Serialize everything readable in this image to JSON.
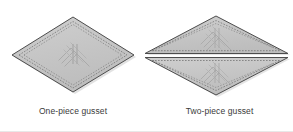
{
  "figure": {
    "width": 293,
    "height": 132,
    "background": "#ffffff",
    "border_color": "#e8e8e8",
    "title": "",
    "panels": [
      {
        "id": "one-piece",
        "caption": "One-piece gusset",
        "shape": "diamond",
        "piece_count": 1,
        "outline_color": "#4d4d4d",
        "fill_color": "#c6c6c6",
        "stitch_color": "#6b6b6b",
        "stitch_style": "dashed",
        "geometry": {
          "left_vertex": [
            12,
            55
          ],
          "top_vertex": [
            73,
            17
          ],
          "right_vertex": [
            134,
            55
          ],
          "bottom_vertex": [
            73,
            92
          ]
        }
      },
      {
        "id": "two-piece",
        "caption": "Two-piece gusset",
        "shape": "split-diamond",
        "piece_count": 2,
        "outline_color": "#4d4d4d",
        "fill_color": "#c6c6c6",
        "stitch_color": "#6b6b6b",
        "stitch_style": "dashed",
        "geometry": {
          "left_vertex": [
            145,
            55
          ],
          "top_vertex": [
            216,
            16
          ],
          "right_vertex": [
            288,
            55
          ],
          "bottom_vertex": [
            216,
            95
          ],
          "split_axis": "horizontal",
          "split_y": 55,
          "seam_gap": 4
        }
      }
    ],
    "captions": {
      "one_piece": "One-piece gusset",
      "two_piece": "Two-piece gusset"
    }
  }
}
